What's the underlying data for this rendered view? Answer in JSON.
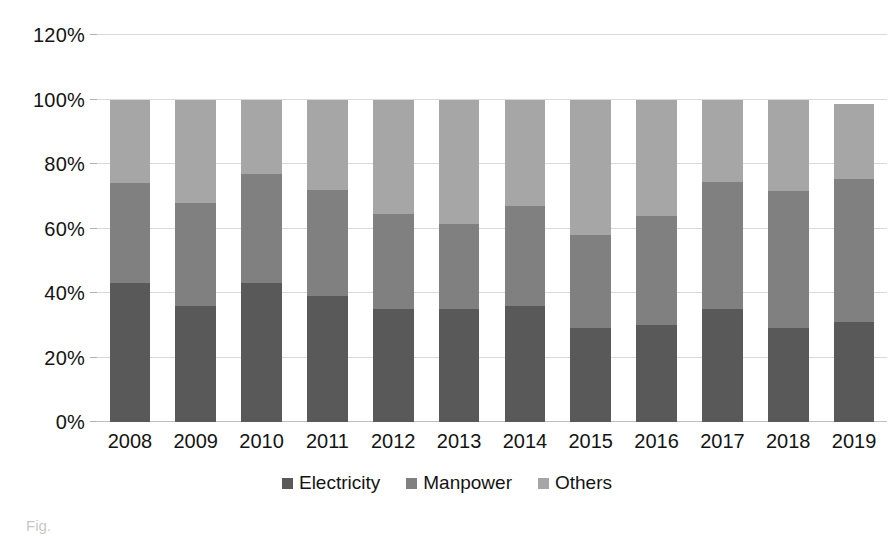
{
  "chart_data": {
    "type": "bar",
    "subtype": "stacked-percent",
    "title": "",
    "xlabel": "",
    "ylabel": "",
    "ylim": [
      0,
      120
    ],
    "ytick_values": [
      0,
      20,
      40,
      60,
      80,
      100,
      120
    ],
    "ytick_labels": [
      "0%",
      "20%",
      "40%",
      "60%",
      "80%",
      "100%",
      "120%"
    ],
    "grid": true,
    "legend_position": "bottom",
    "categories": [
      "2008",
      "2009",
      "2010",
      "2011",
      "2012",
      "2013",
      "2014",
      "2015",
      "2016",
      "2017",
      "2018",
      "2019"
    ],
    "series": [
      {
        "name": "Electricity",
        "color": "#595959",
        "values": [
          43,
          36,
          43,
          39,
          35,
          35,
          36,
          29,
          30,
          35,
          29,
          31
        ]
      },
      {
        "name": "Manpower",
        "color": "#808080",
        "values": [
          31,
          32,
          34,
          33,
          29.5,
          26.5,
          31,
          29,
          34,
          39.5,
          42.5,
          44.5
        ]
      },
      {
        "name": "Others",
        "color": "#a6a6a6",
        "values": [
          26,
          32,
          23,
          28,
          35.5,
          38.5,
          33,
          42,
          36,
          25.5,
          28.5,
          23
        ]
      }
    ],
    "cumulative_tops": {
      "electricity": [
        43,
        36,
        43,
        39,
        35,
        35,
        36,
        29,
        30,
        35,
        29,
        31
      ],
      "manpower": [
        74,
        68,
        77,
        72,
        64.5,
        61.5,
        67,
        58,
        64,
        74.5,
        71.5,
        75.5
      ],
      "others": [
        100,
        100,
        100,
        100,
        100,
        100,
        100,
        100,
        100,
        100,
        100,
        98.5
      ]
    }
  },
  "legend": {
    "items": [
      {
        "label": "Electricity",
        "color": "#595959",
        "marker": "square-marker"
      },
      {
        "label": "Manpower",
        "color": "#808080",
        "marker": "square-marker"
      },
      {
        "label": "Others",
        "color": "#a6a6a6",
        "marker": "square-marker"
      }
    ]
  },
  "caption": {
    "text": "Fig."
  }
}
